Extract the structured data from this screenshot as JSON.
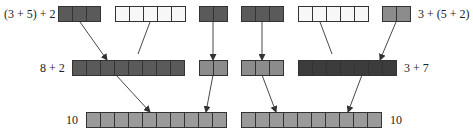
{
  "labels": {
    "left_top": "(3 + 5) + 2",
    "right_top": "3 + (5 + 2)",
    "left_mid": "8 + 2",
    "right_mid": "3 + 7",
    "left_bottom": "10",
    "right_bottom": "10"
  },
  "colors": {
    "dark": "#5a5a5a",
    "white": "#f7f7f7",
    "mid": "#8c8c8c",
    "very_dark": "#3c3c3c",
    "light": "#9a9a9a",
    "border": "#333333",
    "line": "#333333"
  },
  "groups": [
    {
      "id": "top-3-left",
      "x": 58,
      "y": 6,
      "count": 3,
      "fill": "dark"
    },
    {
      "id": "top-5-left",
      "x": 115,
      "y": 6,
      "count": 5,
      "fill": "white"
    },
    {
      "id": "top-2-left",
      "x": 199,
      "y": 6,
      "count": 2,
      "fill": "dark"
    },
    {
      "id": "top-3-right",
      "x": 241,
      "y": 6,
      "count": 3,
      "fill": "dark"
    },
    {
      "id": "top-5-right",
      "x": 298,
      "y": 6,
      "count": 5,
      "fill": "white"
    },
    {
      "id": "top-2-right",
      "x": 382,
      "y": 6,
      "count": 2,
      "fill": "mid"
    },
    {
      "id": "mid-8-left",
      "x": 72,
      "y": 60,
      "count": 8,
      "fill": "dark"
    },
    {
      "id": "mid-2-left",
      "x": 199,
      "y": 60,
      "count": 2,
      "fill": "mid"
    },
    {
      "id": "mid-3-right",
      "x": 241,
      "y": 60,
      "count": 3,
      "fill": "mid"
    },
    {
      "id": "mid-7-right",
      "x": 298,
      "y": 60,
      "count": 7,
      "fill": "very_dark"
    },
    {
      "id": "bottom-10-left",
      "x": 86,
      "y": 112,
      "count": 10,
      "fill": "light"
    },
    {
      "id": "bottom-10-right",
      "x": 241,
      "y": 112,
      "count": 10,
      "fill": "light"
    }
  ],
  "cell": {
    "w": 14,
    "h": 15
  },
  "connectors": [
    {
      "from": [
        80,
        22
      ],
      "to": [
        107,
        60
      ],
      "arrow": true
    },
    {
      "from": [
        150,
        22
      ],
      "to": [
        138,
        54
      ],
      "arrow": false
    },
    {
      "from": [
        213,
        22
      ],
      "to": [
        213,
        60
      ],
      "arrow": true
    },
    {
      "from": [
        262,
        22
      ],
      "to": [
        262,
        60
      ],
      "arrow": true
    },
    {
      "from": [
        320,
        22
      ],
      "to": [
        332,
        54
      ],
      "arrow": false
    },
    {
      "from": [
        396,
        22
      ],
      "to": [
        380,
        60
      ],
      "arrow": true
    },
    {
      "from": [
        116,
        75
      ],
      "to": [
        150,
        112
      ],
      "arrow": true
    },
    {
      "from": [
        213,
        75
      ],
      "to": [
        206,
        112
      ],
      "arrow": true
    },
    {
      "from": [
        262,
        75
      ],
      "to": [
        276,
        112
      ],
      "arrow": true
    },
    {
      "from": [
        362,
        75
      ],
      "to": [
        348,
        112
      ],
      "arrow": true
    }
  ]
}
